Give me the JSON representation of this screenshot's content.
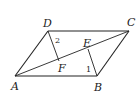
{
  "figure": {
    "type": "geometry-diagram",
    "shape": "parallelogram ABCD",
    "points": {
      "A": {
        "label": "A",
        "x": 15,
        "y": 76
      },
      "B": {
        "label": "B",
        "x": 97,
        "y": 76
      },
      "C": {
        "label": "C",
        "x": 129,
        "y": 31
      },
      "D": {
        "label": "D",
        "x": 48,
        "y": 31
      },
      "E": {
        "label": "E",
        "x": 88,
        "y": 49
      },
      "F": {
        "label": "F",
        "x": 59,
        "y": 61
      }
    },
    "segments": [
      "AB",
      "BC",
      "CD",
      "DA",
      "AC",
      "DF",
      "BE"
    ],
    "angle_labels": {
      "angle1": "1",
      "angle2": "2"
    },
    "colors": {
      "stroke": "#222222",
      "background": "#ffffff"
    }
  }
}
